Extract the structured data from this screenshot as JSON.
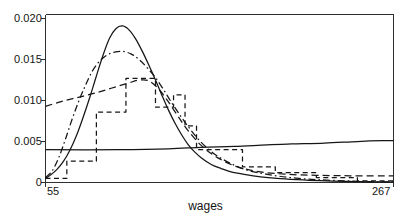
{
  "figure": {
    "background_color": "#ffffff",
    "line_color": "#161616",
    "axis_color": "#303030"
  },
  "axes": {
    "x_title": "wages",
    "y_title": "",
    "x_tick_labels": [
      "55",
      "267"
    ],
    "y_tick_labels": [
      "0.020",
      "0.015",
      "0.010",
      "0.005",
      "0"
    ],
    "x_min": 55,
    "x_max": 267,
    "y_min": 0,
    "y_max": 0.0205
  },
  "chart_data": {
    "type": "line",
    "title": "",
    "xlabel": "wages",
    "ylabel": "",
    "xlim": [
      55,
      267
    ],
    "ylim": [
      0,
      0.0205
    ],
    "xticks": [
      55,
      267
    ],
    "xticklabels": [
      "55",
      "267"
    ],
    "yticks": [
      0,
      0.005,
      0.01,
      0.015,
      0.02
    ],
    "yticklabels": [
      "0",
      "0.005",
      "0.010",
      "0.015",
      "0.020"
    ],
    "grid": false,
    "legend": "none",
    "series": [
      {
        "name": "kernel-density-solid",
        "style": "solid",
        "color": "#161616",
        "x": [
          55,
          58,
          62,
          66,
          70,
          74,
          78,
          82,
          86,
          90,
          94,
          98,
          102,
          106,
          110,
          114,
          118,
          122,
          126,
          130,
          134,
          138,
          142,
          146,
          150,
          156,
          162,
          168,
          176,
          186,
          196,
          208,
          222,
          238,
          252,
          267
        ],
        "y": [
          0.0005,
          0.0009,
          0.0016,
          0.0026,
          0.004,
          0.0058,
          0.008,
          0.0104,
          0.013,
          0.0155,
          0.0176,
          0.0188,
          0.0191,
          0.0186,
          0.0175,
          0.016,
          0.0143,
          0.0125,
          0.0106,
          0.0088,
          0.0072,
          0.0058,
          0.0046,
          0.0037,
          0.003,
          0.0022,
          0.0017,
          0.0013,
          0.001,
          0.0007,
          0.0005,
          0.00035,
          0.00022,
          0.00013,
          8e-05,
          5e-05
        ]
      },
      {
        "name": "estimate-dash-dot",
        "style": "dashdot",
        "color": "#161616",
        "x": [
          55,
          59,
          63,
          67,
          71,
          75,
          79,
          83,
          87,
          92,
          97,
          102,
          107,
          112,
          117,
          122,
          127,
          132,
          137,
          142,
          148,
          154,
          160,
          168,
          178,
          190,
          204,
          220,
          238,
          254,
          267
        ],
        "y": [
          0.0006,
          0.0014,
          0.003,
          0.0052,
          0.0076,
          0.0098,
          0.0117,
          0.0134,
          0.0146,
          0.0155,
          0.0159,
          0.016,
          0.0157,
          0.015,
          0.014,
          0.0128,
          0.0113,
          0.0097,
          0.0082,
          0.0068,
          0.0053,
          0.0041,
          0.0032,
          0.0023,
          0.0015,
          0.001,
          0.0006,
          0.00035,
          0.0002,
          0.0001,
          6e-05
        ]
      },
      {
        "name": "parametric-dashed-smooth",
        "style": "dashed",
        "color": "#161616",
        "x": [
          55,
          65,
          75,
          85,
          95,
          105,
          112,
          118,
          124,
          130,
          136,
          142,
          150,
          160,
          172,
          186,
          202,
          220,
          240,
          267
        ],
        "y": [
          0.0093,
          0.0099,
          0.0104,
          0.0109,
          0.0115,
          0.0121,
          0.0125,
          0.0124,
          0.0114,
          0.0098,
          0.008,
          0.0063,
          0.0045,
          0.003,
          0.0019,
          0.0013,
          0.001,
          0.00088,
          0.00082,
          0.0008
        ]
      },
      {
        "name": "histogram-step-dashed",
        "style": "dashed-step",
        "color": "#161616",
        "x": [
          55,
          68,
          68,
          86,
          86,
          104,
          104,
          122,
          122,
          133,
          133,
          140,
          140,
          147,
          147,
          160,
          160,
          175,
          175,
          195,
          195,
          220,
          220,
          245,
          245,
          267
        ],
        "y": [
          0.0005,
          0.0005,
          0.0026,
          0.0026,
          0.0086,
          0.0086,
          0.0127,
          0.0127,
          0.0092,
          0.0092,
          0.0107,
          0.0107,
          0.0069,
          0.0069,
          0.004,
          0.004,
          0.004,
          0.004,
          0.0019,
          0.0019,
          0.0012,
          0.0012,
          0.0006,
          0.0006,
          0.0002,
          0.0002
        ]
      },
      {
        "name": "baseline-flat-solid",
        "style": "solid",
        "color": "#161616",
        "x": [
          55,
          100,
          130,
          150,
          170,
          190,
          205,
          225,
          245,
          260,
          267
        ],
        "y": [
          0.004,
          0.004,
          0.0041,
          0.0043,
          0.0044,
          0.0046,
          0.0047,
          0.0048,
          0.005,
          0.0051,
          0.0051
        ]
      }
    ]
  }
}
